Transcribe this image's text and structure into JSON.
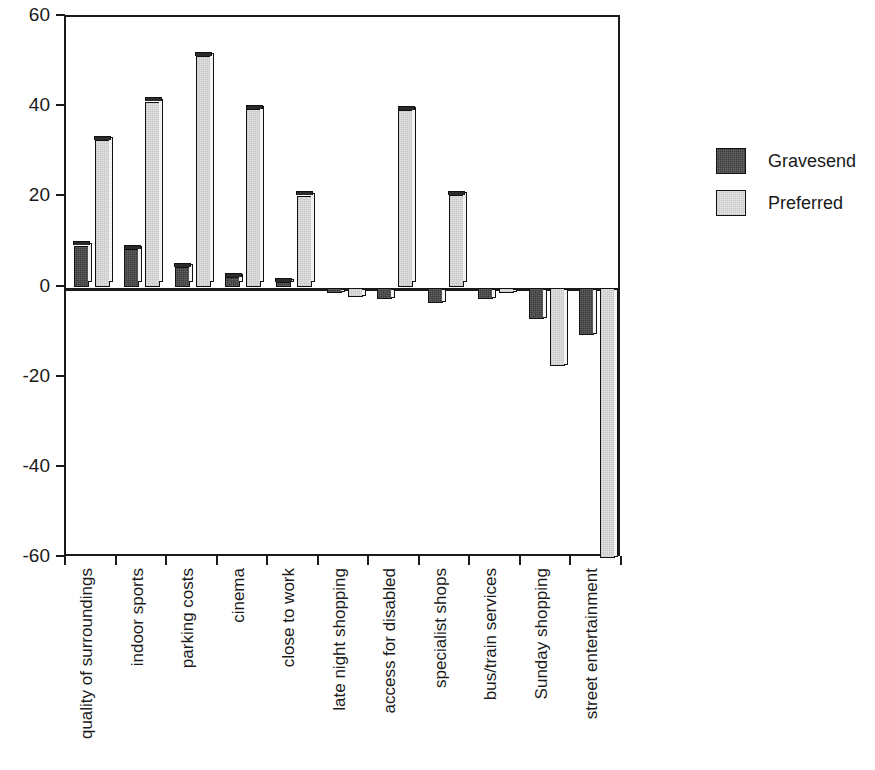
{
  "chart_data": {
    "type": "bar",
    "title": "",
    "xlabel": "",
    "ylabel": "",
    "ylim": [
      -60,
      60
    ],
    "ytick_labels": [
      "60",
      "40",
      "20",
      "0",
      "-20",
      "-40",
      "-60"
    ],
    "yticks": [
      60,
      40,
      20,
      0,
      -20,
      -40,
      -60
    ],
    "grid": false,
    "legend_position": "right",
    "categories": [
      "quality of surroundings",
      "indoor sports",
      "parking costs",
      "cinema",
      "close to work",
      "late night shopping",
      "access for disabled",
      "specialist shops",
      "bus/train services",
      "Sunday shopping",
      "street entertainment"
    ],
    "series": [
      {
        "name": "Gravesend",
        "color": "#3a3a3a",
        "values": [
          9.3,
          8.5,
          4.5,
          2.3,
          1.2,
          -1.3,
          -2.5,
          -3.5,
          -2.5,
          -7.0,
          -10.5
        ]
      },
      {
        "name": "Preferred",
        "color": "#e2e2e2",
        "values": [
          32.7,
          41.2,
          51.3,
          39.5,
          20.3,
          -2.0,
          39.3,
          20.5,
          -1.3,
          -17.5,
          -60.0
        ]
      }
    ]
  },
  "legend": {
    "items": [
      {
        "label": "Gravesend"
      },
      {
        "label": "Preferred"
      }
    ]
  },
  "axes": {
    "zero_value": "0"
  }
}
